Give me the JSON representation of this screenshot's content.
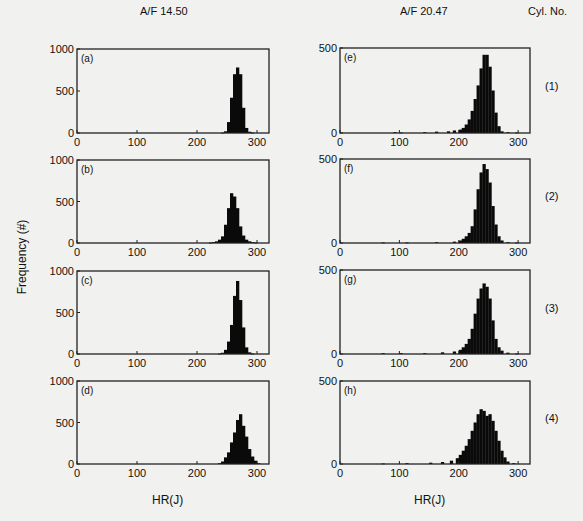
{
  "figure": {
    "column_titles": [
      "A/F 14.50",
      "A/F 20.47"
    ],
    "cyl_header": "Cyl. No.",
    "cyl_labels": [
      "(1)",
      "(2)",
      "(3)",
      "(4)"
    ],
    "ylabel": "Frequency (#)",
    "xlabel": "HR(J)"
  },
  "chart_data": {
    "type": "bar",
    "xlabel": "HR(J)",
    "ylabel": "Frequency (#)",
    "xlim": [
      0,
      320
    ],
    "xticks": [
      0,
      100,
      200,
      300
    ],
    "bin_width": 5,
    "panels": [
      {
        "id": "a",
        "label": "(a)",
        "af": "A/F 14.50",
        "cylinder": 1,
        "ylim": [
          0,
          1000
        ],
        "yticks": [
          0,
          500,
          1000
        ],
        "bins_start": [
          240,
          245,
          250,
          255,
          260,
          265,
          270,
          275,
          280,
          285,
          290
        ],
        "values": [
          5,
          20,
          130,
          420,
          700,
          780,
          700,
          300,
          60,
          15,
          5
        ]
      },
      {
        "id": "b",
        "label": "(b)",
        "af": "A/F 14.50",
        "cylinder": 2,
        "ylim": [
          0,
          1000
        ],
        "yticks": [
          0,
          500,
          1000
        ],
        "bins_start": [
          220,
          225,
          230,
          235,
          240,
          245,
          250,
          255,
          260,
          265,
          270,
          275,
          280,
          285,
          290,
          295
        ],
        "values": [
          5,
          10,
          20,
          40,
          80,
          220,
          420,
          600,
          560,
          420,
          200,
          90,
          40,
          20,
          10,
          5
        ]
      },
      {
        "id": "c",
        "label": "(c)",
        "af": "A/F 14.50",
        "cylinder": 3,
        "ylim": [
          0,
          1000
        ],
        "yticks": [
          0,
          500,
          1000
        ],
        "bins_start": [
          235,
          240,
          245,
          250,
          255,
          260,
          265,
          270,
          275,
          280,
          285,
          290
        ],
        "values": [
          5,
          15,
          50,
          150,
          350,
          700,
          880,
          650,
          320,
          80,
          20,
          5
        ]
      },
      {
        "id": "d",
        "label": "(d)",
        "af": "A/F 14.50",
        "cylinder": 4,
        "ylim": [
          0,
          1000
        ],
        "yticks": [
          0,
          500,
          1000
        ],
        "bins_start": [
          235,
          240,
          245,
          250,
          255,
          260,
          265,
          270,
          275,
          280,
          285,
          290,
          295,
          300
        ],
        "values": [
          10,
          30,
          80,
          140,
          260,
          380,
          530,
          600,
          460,
          330,
          180,
          90,
          40,
          10
        ]
      },
      {
        "id": "e",
        "label": "(e)",
        "af": "A/F 20.47",
        "cylinder": 1,
        "ylim": [
          0,
          500
        ],
        "yticks": [
          0,
          500
        ],
        "bins_start": [
          90,
          100,
          140,
          160,
          180,
          190,
          200,
          205,
          210,
          215,
          220,
          225,
          230,
          235,
          240,
          245,
          250,
          255,
          260,
          265,
          270,
          280,
          295
        ],
        "values": [
          5,
          3,
          5,
          8,
          10,
          15,
          20,
          30,
          50,
          80,
          130,
          200,
          280,
          380,
          460,
          460,
          390,
          250,
          120,
          40,
          10,
          5,
          3
        ]
      },
      {
        "id": "f",
        "label": "(f)",
        "af": "A/F 20.47",
        "cylinder": 2,
        "ylim": [
          0,
          500
        ],
        "yticks": [
          0,
          500
        ],
        "bins_start": [
          70,
          110,
          160,
          190,
          200,
          205,
          210,
          215,
          220,
          225,
          230,
          235,
          240,
          245,
          250,
          255,
          260,
          265,
          270,
          280,
          295
        ],
        "values": [
          3,
          3,
          5,
          8,
          15,
          25,
          40,
          60,
          100,
          200,
          320,
          420,
          470,
          440,
          360,
          220,
          110,
          40,
          15,
          5,
          3
        ]
      },
      {
        "id": "g",
        "label": "(g)",
        "af": "A/F 20.47",
        "cylinder": 3,
        "ylim": [
          0,
          500
        ],
        "yticks": [
          0,
          500
        ],
        "bins_start": [
          70,
          100,
          140,
          170,
          190,
          200,
          205,
          210,
          215,
          220,
          225,
          230,
          235,
          240,
          245,
          250,
          255,
          260,
          265,
          270,
          280,
          295
        ],
        "values": [
          5,
          5,
          5,
          10,
          15,
          25,
          40,
          60,
          90,
          150,
          240,
          330,
          390,
          420,
          400,
          330,
          200,
          90,
          40,
          20,
          8,
          3
        ]
      },
      {
        "id": "h",
        "label": "(h)",
        "af": "A/F 20.47",
        "cylinder": 4,
        "ylim": [
          0,
          500
        ],
        "yticks": [
          0,
          500
        ],
        "bins_start": [
          70,
          110,
          150,
          170,
          185,
          195,
          200,
          205,
          210,
          215,
          220,
          225,
          230,
          235,
          240,
          245,
          250,
          255,
          260,
          265,
          270,
          275,
          280,
          290
        ],
        "values": [
          3,
          5,
          8,
          12,
          20,
          35,
          55,
          80,
          110,
          150,
          200,
          250,
          300,
          330,
          320,
          290,
          300,
          260,
          200,
          140,
          80,
          40,
          15,
          5
        ]
      }
    ]
  },
  "layout": {
    "panels": [
      {
        "x": 77,
        "y": 49,
        "w": 192,
        "h": 84
      },
      {
        "x": 77,
        "y": 160,
        "w": 192,
        "h": 83
      },
      {
        "x": 77,
        "y": 271,
        "w": 192,
        "h": 83
      },
      {
        "x": 77,
        "y": 381,
        "w": 192,
        "h": 83
      },
      {
        "x": 340,
        "y": 48,
        "w": 190,
        "h": 85
      },
      {
        "x": 340,
        "y": 159,
        "w": 190,
        "h": 84
      },
      {
        "x": 340,
        "y": 270,
        "w": 190,
        "h": 84
      },
      {
        "x": 340,
        "y": 381,
        "w": 190,
        "h": 83
      }
    ],
    "cyl_label_y": [
      80,
      190,
      302,
      412
    ],
    "bar_color": "#0a0a0a",
    "frame_color": "#222222"
  }
}
